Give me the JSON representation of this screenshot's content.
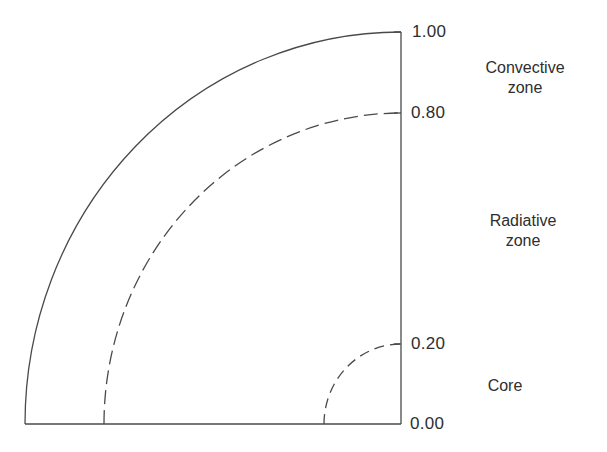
{
  "diagram": {
    "type": "quarter-circle cross-section of a star (solar interior)",
    "line_color": "#444444",
    "ticks": [
      {
        "value": "1.00"
      },
      {
        "value": "0.80"
      },
      {
        "value": "0.20"
      },
      {
        "value": "0.00"
      }
    ],
    "zones": [
      {
        "line1": "Convective",
        "line2": "zone"
      },
      {
        "line1": "Radiative",
        "line2": "zone"
      },
      {
        "line1": "Core",
        "line2": ""
      }
    ],
    "boundaries": [
      {
        "radius_fraction": 1.0,
        "style": "solid"
      },
      {
        "radius_fraction": 0.8,
        "style": "dashed"
      },
      {
        "radius_fraction": 0.2,
        "style": "dashed"
      }
    ]
  }
}
